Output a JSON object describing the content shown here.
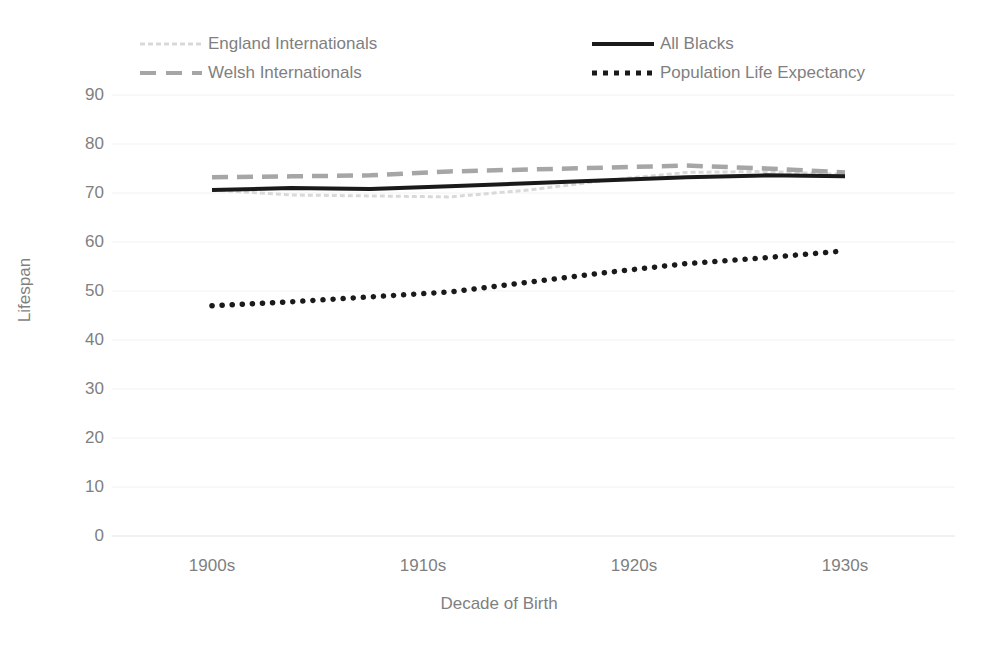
{
  "chart_data": {
    "type": "line",
    "title": "",
    "xlabel": "Decade of Birth",
    "ylabel": "Lifespan",
    "x": [
      "1900s",
      "1910s",
      "1920s",
      "1930s"
    ],
    "categories": [
      "1900s",
      "1910s",
      "1920s",
      "1930s"
    ],
    "ylim": [
      0,
      90
    ],
    "ytick_step": 10,
    "yticks": [
      90,
      80,
      70,
      60,
      50,
      40,
      30,
      20,
      10,
      0
    ],
    "grid": true,
    "grid_axis": "y",
    "legend_position": "top",
    "series": [
      {
        "name": "England Internationals",
        "color": "#d9d9d9",
        "style": "fine-dash",
        "values": [
          70.6,
          69.2,
          74.2,
          73.8
        ],
        "points": [
          {
            "x": "1900s",
            "y": 70.6
          },
          {
            "x": "1903s",
            "y": 69.6
          },
          {
            "x": "1907s",
            "y": 69.4
          },
          {
            "x": "1910s",
            "y": 69.2
          },
          {
            "x": "1913s",
            "y": 70.6
          },
          {
            "x": "1917s",
            "y": 72.6
          },
          {
            "x": "1920s",
            "y": 74.2
          },
          {
            "x": "1925s",
            "y": 74.4
          },
          {
            "x": "1930s",
            "y": 73.8
          }
        ]
      },
      {
        "name": "Welsh Internationals",
        "color": "#a6a6a6",
        "style": "dashed",
        "values": [
          73.2,
          74.4,
          75.6,
          74.2
        ],
        "points": [
          {
            "x": "1900s",
            "y": 73.2
          },
          {
            "x": "1903s",
            "y": 73.4
          },
          {
            "x": "1907s",
            "y": 73.6
          },
          {
            "x": "1910s",
            "y": 74.4
          },
          {
            "x": "1913s",
            "y": 74.8
          },
          {
            "x": "1917s",
            "y": 75.2
          },
          {
            "x": "1920s",
            "y": 75.6
          },
          {
            "x": "1925s",
            "y": 75.0
          },
          {
            "x": "1930s",
            "y": 74.2
          }
        ]
      },
      {
        "name": "All Blacks",
        "color": "#1a1a1a",
        "style": "solid",
        "values": [
          70.6,
          71.4,
          73.2,
          73.4
        ],
        "points": [
          {
            "x": "1900s",
            "y": 70.6
          },
          {
            "x": "1903s",
            "y": 71.0
          },
          {
            "x": "1907s",
            "y": 70.8
          },
          {
            "x": "1910s",
            "y": 71.4
          },
          {
            "x": "1913s",
            "y": 72.0
          },
          {
            "x": "1917s",
            "y": 72.6
          },
          {
            "x": "1920s",
            "y": 73.2
          },
          {
            "x": "1925s",
            "y": 73.6
          },
          {
            "x": "1930s",
            "y": 73.4
          }
        ]
      },
      {
        "name": "Population Life Expectancy",
        "color": "#1a1a1a",
        "style": "dotted",
        "values": [
          47.0,
          49.8,
          55.6,
          58.2
        ],
        "points": [
          {
            "x": "1900s",
            "y": 47.0
          },
          {
            "x": "1903s",
            "y": 47.8
          },
          {
            "x": "1907s",
            "y": 48.8
          },
          {
            "x": "1910s",
            "y": 49.8
          },
          {
            "x": "1913s",
            "y": 51.8
          },
          {
            "x": "1917s",
            "y": 53.8
          },
          {
            "x": "1920s",
            "y": 55.6
          },
          {
            "x": "1925s",
            "y": 56.8
          },
          {
            "x": "1930s",
            "y": 58.2
          }
        ]
      }
    ]
  },
  "legend": {
    "entries": [
      {
        "label": "England Internationals"
      },
      {
        "label": "Welsh Internationals"
      },
      {
        "label": "All Blacks"
      },
      {
        "label": "Population Life Expectancy"
      }
    ]
  },
  "axes": {
    "y_title": "Lifespan",
    "x_title": "Decade of Birth",
    "y_labels": [
      "90",
      "80",
      "70",
      "60",
      "50",
      "40",
      "30",
      "20",
      "10",
      "0"
    ],
    "x_labels": [
      "1900s",
      "1910s",
      "1920s",
      "1930s"
    ]
  },
  "colors": {
    "england": "#d9d9d9",
    "welsh": "#a6a6a6",
    "all_blacks": "#1a1a1a",
    "population": "#1a1a1a",
    "grid": "#f2f2f2",
    "text": "#7f7f7f"
  }
}
